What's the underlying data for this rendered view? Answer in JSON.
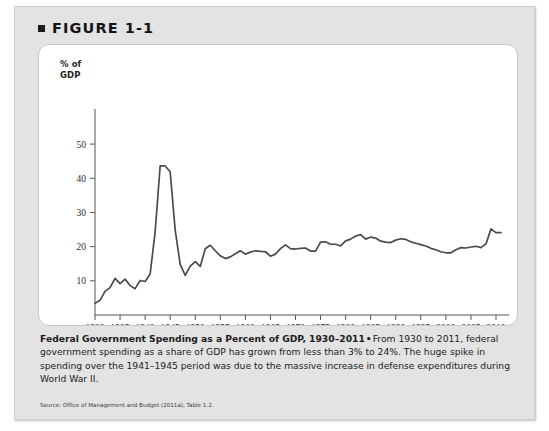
{
  "figure": {
    "bullet_icon": "square-bullet-icon",
    "label": "FIGURE 1-1"
  },
  "chart_card": {
    "axis_title_line1": "% of",
    "axis_title_line2": "GDP"
  },
  "caption": {
    "title": "Federal Government Spending as a Percent of GDP, 1930–2011",
    "separator": "•",
    "body": "From 1930 to 2011, federal government spending as a share of GDP has grown from less than 3% to 24%. The huge spike in spending over the 1941–1945 period was due to the massive increase in defense expenditures during World War II."
  },
  "source": {
    "text": "Source: Office of Management and Budget (2011a), Table 1.2."
  },
  "colors": {
    "panel_background": "#e3e3e3",
    "card_background": "#ffffff",
    "line": "#4a4a4a",
    "axis": "#555555",
    "text": "#1c1c1c"
  },
  "chart_data": {
    "type": "line",
    "title": "Federal Government Spending as a Percent of GDP, 1930–2011",
    "xlabel": "",
    "ylabel": "% of GDP",
    "xlim": [
      1930,
      2011
    ],
    "ylim": [
      0,
      55
    ],
    "yticks": [
      10,
      20,
      30,
      40,
      50
    ],
    "xticks": [
      1930,
      1935,
      1940,
      1945,
      1950,
      1955,
      1960,
      1965,
      1970,
      1975,
      1980,
      1985,
      1990,
      1995,
      2000,
      2005,
      2010
    ],
    "grid": false,
    "legend": false,
    "series": [
      {
        "name": "Federal spending as % of GDP",
        "x": [
          1930,
          1931,
          1932,
          1933,
          1934,
          1935,
          1936,
          1937,
          1938,
          1939,
          1940,
          1941,
          1942,
          1943,
          1944,
          1945,
          1946,
          1947,
          1948,
          1949,
          1950,
          1951,
          1952,
          1953,
          1954,
          1955,
          1956,
          1957,
          1958,
          1959,
          1960,
          1961,
          1962,
          1963,
          1964,
          1965,
          1966,
          1967,
          1968,
          1969,
          1970,
          1971,
          1972,
          1973,
          1974,
          1975,
          1976,
          1977,
          1978,
          1979,
          1980,
          1981,
          1982,
          1983,
          1984,
          1985,
          1986,
          1987,
          1988,
          1989,
          1990,
          1991,
          1992,
          1993,
          1994,
          1995,
          1996,
          1997,
          1998,
          1999,
          2000,
          2001,
          2002,
          2003,
          2004,
          2005,
          2006,
          2007,
          2008,
          2009,
          2010,
          2011
        ],
        "values": [
          3.4,
          4.3,
          6.9,
          8.0,
          10.7,
          9.2,
          10.5,
          8.6,
          7.7,
          10.1,
          9.8,
          12.0,
          24.3,
          43.6,
          43.6,
          41.9,
          24.8,
          14.8,
          11.6,
          14.3,
          15.6,
          14.2,
          19.4,
          20.4,
          18.8,
          17.3,
          16.5,
          17.0,
          17.9,
          18.8,
          17.8,
          18.4,
          18.8,
          18.6,
          18.5,
          17.2,
          17.8,
          19.4,
          20.5,
          19.4,
          19.3,
          19.5,
          19.6,
          18.7,
          18.7,
          21.3,
          21.4,
          20.7,
          20.7,
          20.2,
          21.7,
          22.2,
          23.1,
          23.5,
          22.2,
          22.8,
          22.5,
          21.6,
          21.3,
          21.2,
          21.9,
          22.3,
          22.1,
          21.4,
          21.0,
          20.6,
          20.2,
          19.5,
          19.1,
          18.5,
          18.2,
          18.2,
          19.1,
          19.7,
          19.6,
          19.9,
          20.1,
          19.7,
          20.8,
          25.2,
          24.1,
          24.1
        ]
      }
    ]
  }
}
